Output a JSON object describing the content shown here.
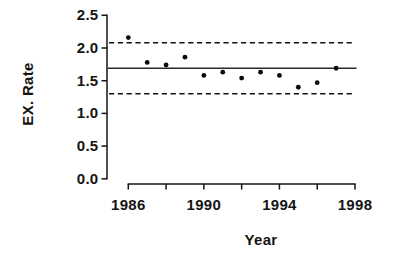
{
  "figure": {
    "kind": "statistical-control-chart",
    "background_color": "#ffffff",
    "ink_color": "#141414"
  },
  "chart_data": {
    "type": "scatter",
    "title": "",
    "xlabel": "Year",
    "ylabel": "EX. Rate",
    "x": [
      1986,
      1987,
      1988,
      1989,
      1990,
      1991,
      1992,
      1993,
      1994,
      1995,
      1996,
      1997
    ],
    "values": [
      2.16,
      1.78,
      1.74,
      1.86,
      1.58,
      1.63,
      1.54,
      1.63,
      1.58,
      1.4,
      1.47,
      1.69
    ],
    "center_line": 1.69,
    "upper_dashed_line": 2.08,
    "lower_dashed_line": 1.3,
    "xlim": [
      1986,
      1998
    ],
    "ylim": [
      0.0,
      2.5
    ],
    "x_tick_step": 2,
    "x_major_tick_labels": [
      "1986",
      "1990",
      "1994",
      "1998"
    ],
    "x_major_tick_values": [
      1986,
      1990,
      1994,
      1998
    ],
    "x_minor_tick_values": [
      1988,
      1992,
      1996
    ],
    "y_tick_labels": [
      "0.0",
      "0.5",
      "1.0",
      "1.5",
      "2.0",
      "2.5"
    ],
    "y_tick_values": [
      0.0,
      0.5,
      1.0,
      1.5,
      2.0,
      2.5
    ],
    "grid": false,
    "legend": "none",
    "marker": "filled-circle",
    "marker_color": "#0a0a0a",
    "line_color": "#2a2a2a"
  }
}
